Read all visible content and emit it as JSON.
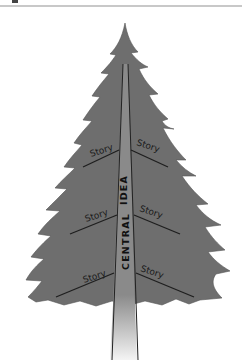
{
  "diagram": {
    "type": "tree-metaphor",
    "trunk_label_part1": "CENTRAL",
    "trunk_label_part2": "IDEA",
    "branches": [
      {
        "side": "left",
        "tier": 1,
        "label": "Story"
      },
      {
        "side": "right",
        "tier": 1,
        "label": "Story"
      },
      {
        "side": "left",
        "tier": 2,
        "label": "Story"
      },
      {
        "side": "right",
        "tier": 2,
        "label": "Story"
      },
      {
        "side": "left",
        "tier": 3,
        "label": "Story"
      },
      {
        "side": "right",
        "tier": 3,
        "label": "Story"
      }
    ],
    "colors": {
      "foliage": "#6e6e6e",
      "trunk_top": "#8a8a8a",
      "trunk_bottom": "#f2f2f2",
      "lines": "#1e1e1e",
      "rule": "#c8c8c8"
    }
  }
}
